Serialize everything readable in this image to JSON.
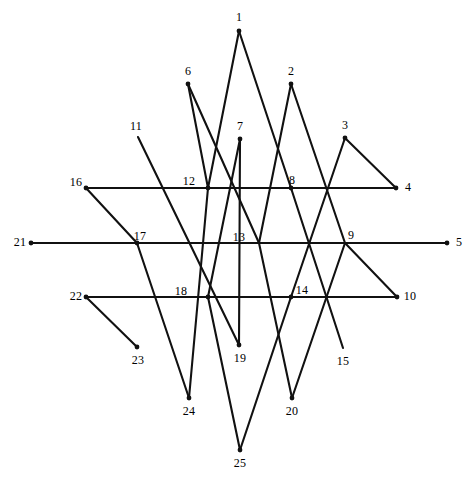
{
  "figure": {
    "title": "",
    "width": 471,
    "height": 482,
    "background_color": "#ffffff",
    "stroke_color": "#111111",
    "stroke_width": 2.1,
    "label_color": "#000000",
    "label_font_size": 12,
    "vertex_count": 25
  },
  "chart_data": {
    "type": "diagram",
    "subtype": "zigzag-star-polygon-path",
    "title": "",
    "xlabel": "",
    "ylabel": "",
    "grid": false,
    "legend": null,
    "point_labels": [
      "1",
      "2",
      "3",
      "4",
      "5",
      "6",
      "7",
      "8",
      "9",
      "10",
      "11",
      "12",
      "13",
      "14",
      "15",
      "16",
      "17",
      "18",
      "19",
      "20",
      "21",
      "22",
      "23",
      "24",
      "25"
    ],
    "points": [
      {
        "id": 1,
        "label": "1",
        "x": 239,
        "y": 31,
        "label_x": 239,
        "label_y": 17,
        "dot": true
      },
      {
        "id": 2,
        "label": "2",
        "x": 291,
        "y": 84,
        "label_x": 291,
        "label_y": 71,
        "dot": true
      },
      {
        "id": 3,
        "label": "3",
        "x": 345,
        "y": 138,
        "label_x": 345,
        "label_y": 125,
        "dot": true
      },
      {
        "id": 4,
        "label": "4",
        "x": 396,
        "y": 188,
        "label_x": 408,
        "label_y": 187,
        "dot": true
      },
      {
        "id": 5,
        "label": "5",
        "x": 447,
        "y": 243,
        "label_x": 459,
        "label_y": 242,
        "dot": true
      },
      {
        "id": 6,
        "label": "6",
        "x": 188,
        "y": 84,
        "label_x": 188,
        "label_y": 71,
        "dot": true
      },
      {
        "id": 7,
        "label": "7",
        "x": 240,
        "y": 139,
        "label_x": 240,
        "label_y": 126,
        "dot": true
      },
      {
        "id": 8,
        "label": "8",
        "x": 291,
        "y": 188,
        "label_x": 292,
        "label_y": 180,
        "dot": true
      },
      {
        "id": 9,
        "label": "9",
        "x": 345,
        "y": 243,
        "label_x": 351,
        "label_y": 235,
        "dot": false
      },
      {
        "id": 10,
        "label": "10",
        "x": 397,
        "y": 297,
        "label_x": 410,
        "label_y": 296,
        "dot": true
      },
      {
        "id": 11,
        "label": "11",
        "x": 138,
        "y": 137,
        "label_x": 136,
        "label_y": 126,
        "dot": false
      },
      {
        "id": 12,
        "label": "12",
        "x": 208,
        "y": 188,
        "label_x": 189,
        "label_y": 181,
        "dot": true
      },
      {
        "id": 13,
        "label": "13",
        "x": 259,
        "y": 243,
        "label_x": 239,
        "label_y": 237,
        "dot": false
      },
      {
        "id": 14,
        "label": "14",
        "x": 291,
        "y": 297,
        "label_x": 302,
        "label_y": 290,
        "dot": true
      },
      {
        "id": 15,
        "label": "15",
        "x": 343,
        "y": 348,
        "label_x": 343,
        "label_y": 361,
        "dot": false
      },
      {
        "id": 16,
        "label": "16",
        "x": 86,
        "y": 188,
        "label_x": 76,
        "label_y": 182,
        "dot": true
      },
      {
        "id": 17,
        "label": "17",
        "x": 137,
        "y": 243,
        "label_x": 140,
        "label_y": 236,
        "dot": true
      },
      {
        "id": 18,
        "label": "18",
        "x": 208,
        "y": 297,
        "label_x": 181,
        "label_y": 291,
        "dot": true
      },
      {
        "id": 19,
        "label": "19",
        "x": 239,
        "y": 345,
        "label_x": 240,
        "label_y": 358,
        "dot": true
      },
      {
        "id": 20,
        "label": "20",
        "x": 292,
        "y": 398,
        "label_x": 292,
        "label_y": 411,
        "dot": true
      },
      {
        "id": 21,
        "label": "21",
        "x": 31,
        "y": 243,
        "label_x": 20,
        "label_y": 242,
        "dot": true
      },
      {
        "id": 22,
        "label": "22",
        "x": 86,
        "y": 297,
        "label_x": 76,
        "label_y": 296,
        "dot": true
      },
      {
        "id": 23,
        "label": "23",
        "x": 137,
        "y": 347,
        "label_x": 138,
        "label_y": 360,
        "dot": true
      },
      {
        "id": 24,
        "label": "24",
        "x": 189,
        "y": 398,
        "label_x": 189,
        "label_y": 411,
        "dot": true
      },
      {
        "id": 25,
        "label": "25",
        "x": 240,
        "y": 450,
        "label_x": 240,
        "label_y": 463,
        "dot": true
      }
    ],
    "edges": [
      {
        "from": 21,
        "to": 5,
        "kind": "horizontal"
      },
      {
        "from": 16,
        "to": 4,
        "kind": "horizontal"
      },
      {
        "from": 22,
        "to": 10,
        "kind": "horizontal"
      },
      {
        "from": 16,
        "to": 17,
        "kind": "short-diagonal"
      },
      {
        "from": 3,
        "to": 4,
        "kind": "short-diagonal"
      },
      {
        "from": 22,
        "to": 23,
        "kind": "short-diagonal"
      },
      {
        "from": 9,
        "to": 10,
        "kind": "short-diagonal"
      },
      {
        "from": 1,
        "to": 12,
        "kind": "long-diagonal"
      },
      {
        "from": 12,
        "to": 24,
        "kind": "long-diagonal"
      },
      {
        "from": 6,
        "to": 13,
        "kind": "long-diagonal"
      },
      {
        "from": 13,
        "to": 20,
        "kind": "long-diagonal"
      },
      {
        "from": 11,
        "to": 19,
        "kind": "long-diagonal"
      },
      {
        "from": 7,
        "to": 19,
        "kind": "long-diagonal"
      },
      {
        "from": 7,
        "to": 18,
        "kind": "long-diagonal"
      },
      {
        "from": 18,
        "to": 25,
        "kind": "long-diagonal"
      },
      {
        "from": 2,
        "to": 13,
        "kind": "long-diagonal"
      },
      {
        "from": 8,
        "to": 15,
        "kind": "long-diagonal"
      },
      {
        "from": 3,
        "to": 14,
        "kind": "long-diagonal"
      },
      {
        "from": 1,
        "to": 8,
        "kind": "long-diagonal"
      },
      {
        "from": 6,
        "to": 12,
        "kind": "long-diagonal"
      },
      {
        "from": 17,
        "to": 24,
        "kind": "long-diagonal"
      },
      {
        "from": 2,
        "to": 9,
        "kind": "long-diagonal"
      },
      {
        "from": 25,
        "to": 14,
        "kind": "long-diagonal"
      },
      {
        "from": 20,
        "to": 9,
        "kind": "long-diagonal"
      }
    ]
  }
}
